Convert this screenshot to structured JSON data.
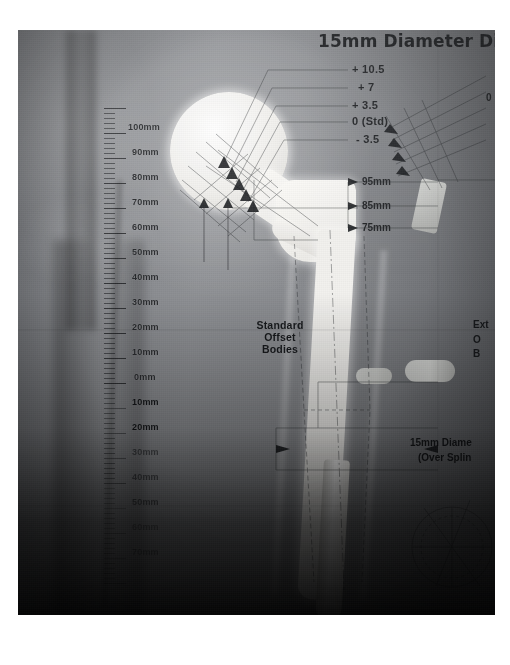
{
  "image": {
    "kind": "radiograph-templating-overlay",
    "title_top": "15mm Diameter Dist",
    "caption_bottom_right": "135mm Stem"
  },
  "offset_labels": [
    {
      "text": "+ 10.5"
    },
    {
      "text": "+ 7"
    },
    {
      "text": "+ 3.5"
    },
    {
      "text": "0 (Std)"
    },
    {
      "text": "- 3.5"
    }
  ],
  "neck_length_labels": [
    {
      "text": "95mm"
    },
    {
      "text": "85mm"
    },
    {
      "text": "75mm"
    }
  ],
  "annotations": {
    "standard_offset": "Standard\nOffset\nBodies",
    "standard_offset_lines": [
      "Standard",
      "Offset",
      "Bodies"
    ],
    "extended_offset_lines": [
      "Ext",
      "O",
      "B"
    ],
    "diameter_note_lines": [
      "15mm Diame",
      "(Over Splin"
    ],
    "protractor_zero": "0"
  },
  "ruler": {
    "above_zero": [
      "100mm",
      "90mm",
      "80mm",
      "70mm",
      "60mm",
      "50mm",
      "40mm",
      "30mm",
      "20mm",
      "10mm"
    ],
    "zero": "0mm",
    "below_zero": [
      "10mm",
      "20mm",
      "30mm",
      "40mm",
      "50mm",
      "60mm",
      "70mm"
    ]
  },
  "colors": {
    "film_mid": "#86888c",
    "film_dark": "#1a1c1f",
    "metal_bright": "#f2f1ee",
    "ink": "#16181b",
    "paper": "#ffffff"
  }
}
